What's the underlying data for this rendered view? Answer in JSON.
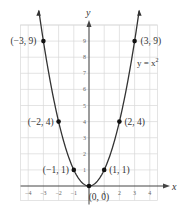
{
  "chart_data": {
    "type": "line",
    "title": "",
    "xlabel": "x",
    "ylabel": "y",
    "equation_label": "y = x²",
    "equation_label_parts": {
      "lhs": "y = x",
      "exp": "2"
    },
    "function": "y = x^2",
    "xlim": [
      -4.5,
      4.5
    ],
    "ylim": [
      -1,
      10
    ],
    "grid": true,
    "x_ticks": [
      -4,
      -3,
      -2,
      -1,
      1,
      2,
      3,
      4
    ],
    "x_tick_labels": [
      "−4",
      "−3",
      "−2",
      "−1",
      "1",
      "2",
      "3",
      "4"
    ],
    "y_ticks": [
      1,
      2,
      3,
      4,
      5,
      6,
      7,
      8,
      9
    ],
    "y_tick_labels": [
      "1",
      "2",
      "3",
      "4",
      "5",
      "6",
      "7",
      "8",
      "9"
    ],
    "series": [
      {
        "name": "y = x²",
        "x": [
          -3,
          -2,
          -1,
          0,
          1,
          2,
          3
        ],
        "y": [
          9,
          4,
          1,
          0,
          1,
          4,
          9
        ],
        "marked_points": [
          {
            "x": -3,
            "y": 9,
            "label": "(−3, 9)"
          },
          {
            "x": -2,
            "y": 4,
            "label": "(−2, 4)"
          },
          {
            "x": -1,
            "y": 1,
            "label": "(−1, 1)"
          },
          {
            "x": 0,
            "y": 0,
            "label": "(0, 0)"
          },
          {
            "x": 1,
            "y": 1,
            "label": "(1, 1)"
          },
          {
            "x": 2,
            "y": 4,
            "label": "(2, 4)"
          },
          {
            "x": 3,
            "y": 9,
            "label": "(3, 9)"
          }
        ]
      }
    ]
  },
  "colors": {
    "curve": "#333333",
    "grid": "#d9d9d9",
    "axis": "#444444",
    "point": "#111111"
  }
}
